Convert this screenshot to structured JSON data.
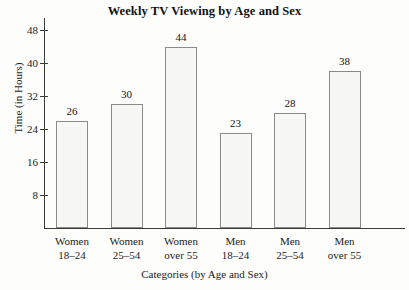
{
  "chart_data": {
    "type": "bar",
    "title": "Weekly TV Viewing by Age and Sex",
    "xlabel": "Categories (by Age and Sex)",
    "ylabel": "Time (in Hours)",
    "categories": [
      "Women 18–24",
      "Women 25–54",
      "Women over 55",
      "Men 18–24",
      "Men 25–54",
      "Men over 55"
    ],
    "category_lines": [
      [
        "Women",
        "18–24"
      ],
      [
        "Women",
        "25–54"
      ],
      [
        "Women",
        "over 55"
      ],
      [
        "Men",
        "18–24"
      ],
      [
        "Men",
        "25–54"
      ],
      [
        "Men",
        "over 55"
      ]
    ],
    "values": [
      26,
      30,
      44,
      23,
      28,
      38
    ],
    "value_labels": [
      "26",
      "30",
      "44",
      "23",
      "28",
      "38"
    ],
    "yticks": [
      8,
      16,
      24,
      32,
      40,
      48
    ],
    "ytick_labels": [
      "8",
      "16",
      "24",
      "32",
      "40",
      "48"
    ],
    "ylim": [
      0,
      52
    ],
    "grid": false,
    "legend": false,
    "bar_fill": "#f7f7f5",
    "bar_outline": "#8a8a8a",
    "axis_color": "#3a3a3a",
    "text_color": "#1c1c1c"
  }
}
